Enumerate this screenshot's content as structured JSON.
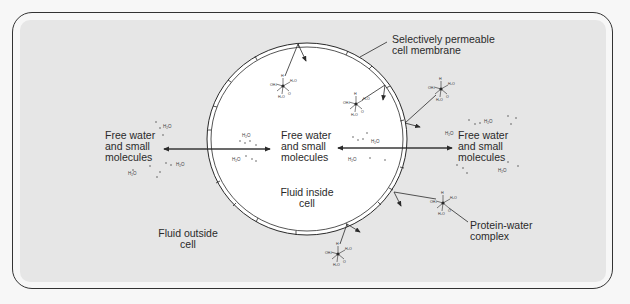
{
  "diagram": {
    "labels": {
      "membrane": [
        "Selectively permeable",
        "cell membrane"
      ],
      "left_free": [
        "Free water",
        "and small",
        "molecules"
      ],
      "center_free": [
        "Free water",
        "and small",
        "molecules"
      ],
      "right_free": [
        "Free water",
        "and small",
        "molecules"
      ],
      "inside": [
        "Fluid inside",
        "cell"
      ],
      "outside": [
        "Fluid outside",
        "cell"
      ],
      "protein": [
        "Protein-water",
        "complex"
      ]
    },
    "molecule_label": "H2O",
    "colors": {
      "panel": "#e6e6e6",
      "cell": "#ffffff",
      "ink": "#2a2a2a",
      "background": "#f7f7f7"
    }
  }
}
